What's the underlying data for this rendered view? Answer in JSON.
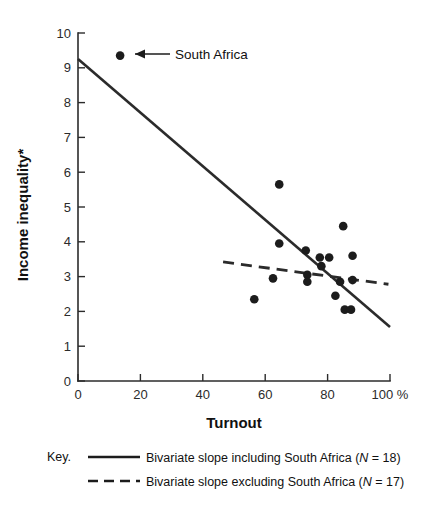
{
  "chart_data": {
    "type": "scatter",
    "title": "",
    "xlabel": "Turnout",
    "ylabel": "Income inequality*",
    "x_unit_suffix": "%",
    "xlim": [
      0,
      100
    ],
    "ylim": [
      0,
      10
    ],
    "grid": false,
    "x_ticks": [
      0,
      20,
      40,
      60,
      80,
      100
    ],
    "x_tick_labels": [
      "0",
      "20",
      "40",
      "60",
      "80",
      "100 %"
    ],
    "y_ticks": [
      0,
      1,
      2,
      3,
      4,
      5,
      6,
      7,
      8,
      9,
      10
    ],
    "y_tick_labels": [
      "0",
      "1",
      "2",
      "3",
      "4",
      "5",
      "6",
      "7",
      "8",
      "9",
      "10"
    ],
    "points": [
      {
        "x": 13.5,
        "y": 9.35,
        "label": "South Africa"
      },
      {
        "x": 64.5,
        "y": 5.65,
        "label": ""
      },
      {
        "x": 85.0,
        "y": 4.45,
        "label": ""
      },
      {
        "x": 64.5,
        "y": 3.95,
        "label": ""
      },
      {
        "x": 73.0,
        "y": 3.75,
        "label": ""
      },
      {
        "x": 77.5,
        "y": 3.55,
        "label": ""
      },
      {
        "x": 80.5,
        "y": 3.55,
        "label": ""
      },
      {
        "x": 88.0,
        "y": 3.6,
        "label": ""
      },
      {
        "x": 78.0,
        "y": 3.3,
        "label": ""
      },
      {
        "x": 62.5,
        "y": 2.95,
        "label": ""
      },
      {
        "x": 73.5,
        "y": 3.05,
        "label": ""
      },
      {
        "x": 73.5,
        "y": 2.85,
        "label": ""
      },
      {
        "x": 84.0,
        "y": 2.85,
        "label": ""
      },
      {
        "x": 88.0,
        "y": 2.9,
        "label": ""
      },
      {
        "x": 56.5,
        "y": 2.35,
        "label": ""
      },
      {
        "x": 82.5,
        "y": 2.45,
        "label": ""
      },
      {
        "x": 85.5,
        "y": 2.05,
        "label": ""
      },
      {
        "x": 87.5,
        "y": 2.05,
        "label": ""
      }
    ],
    "series": [
      {
        "name": "Bivariate slope including South Africa",
        "style": "solid",
        "n": 18,
        "x_start": 0,
        "y_start": 9.25,
        "x_end": 100,
        "y_end": 1.55
      },
      {
        "name": "Bivariate slope excluding South Africa",
        "style": "dashed",
        "n": 17,
        "x_start": 46.5,
        "y_start": 3.42,
        "x_end": 99.5,
        "y_end": 2.78
      }
    ],
    "annotations": [
      {
        "text": "South Africa",
        "points_to_x": 13.5,
        "points_to_y": 9.35
      }
    ]
  },
  "axes": {
    "y_title": "Income inequality*",
    "x_title": "Turnout"
  },
  "legend": {
    "key_word": "Key.",
    "entries": [
      {
        "style": "solid",
        "text_before": "Bivariate slope including South Africa (",
        "n_symbol": "N",
        "n_equals": " = 18)"
      },
      {
        "style": "dashed",
        "text_before": "Bivariate slope excluding South Africa (",
        "n_symbol": "N",
        "n_equals": " = 17)"
      }
    ]
  },
  "colors": {
    "ink": "#1c1c1c",
    "axis": "#2b2b2b",
    "background": "#ffffff"
  }
}
